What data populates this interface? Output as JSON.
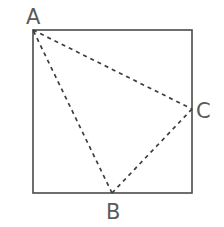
{
  "figure": {
    "kind": "geometry-diagram",
    "background_color": "#ffffff",
    "canvas": {
      "width": 224,
      "height": 227
    },
    "square": {
      "name": "outer-square",
      "stroke_color": "#4a4a4a",
      "stroke_width": 1.6,
      "fill": "none",
      "corners": {
        "top_left": [
          33,
          30
        ],
        "top_right": [
          192,
          30
        ],
        "bottom_right": [
          192,
          193
        ],
        "bottom_left": [
          33,
          193
        ]
      }
    },
    "triangle": {
      "name": "triangle-ABC",
      "stroke_color": "#3d3d3d",
      "stroke_width": 1.7,
      "fill": "none",
      "dash_pattern": "4 4",
      "vertices": [
        {
          "id": "A",
          "x": 33,
          "y": 30,
          "on": "square-top-left-corner"
        },
        {
          "id": "B",
          "x": 112,
          "y": 193,
          "on": "square-bottom-edge"
        },
        {
          "id": "C",
          "x": 192,
          "y": 109,
          "on": "square-right-edge"
        }
      ],
      "edges": [
        {
          "from": "A",
          "to": "C"
        },
        {
          "from": "C",
          "to": "B"
        },
        {
          "from": "B",
          "to": "A"
        }
      ]
    },
    "labels": [
      {
        "id": "label-A",
        "text": "A",
        "x": 26,
        "y": 24,
        "anchor": "start",
        "color": "#5b5b5b"
      },
      {
        "id": "label-B",
        "text": "B",
        "x": 106,
        "y": 219,
        "anchor": "start",
        "color": "#5b5b5b"
      },
      {
        "id": "label-C",
        "text": "C",
        "x": 196,
        "y": 118,
        "anchor": "start",
        "color": "#5b5b5b"
      }
    ]
  }
}
